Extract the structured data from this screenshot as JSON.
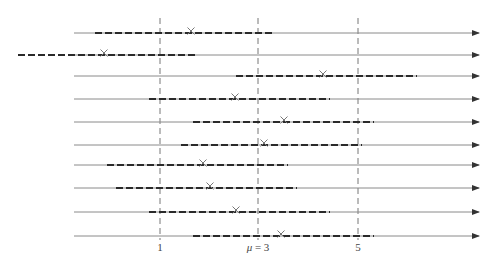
{
  "diagram": {
    "colors": {
      "axis_line": "#8a8a8a",
      "interval": "#2a2a2a",
      "reference": "#777777",
      "marker": "#777777"
    },
    "scale": {
      "x_px_at_value_1": 160,
      "px_per_unit": 49.5
    },
    "axis": {
      "x_start": 74,
      "x_end": 479
    },
    "reference_lines": [
      {
        "value": 1,
        "x": 160,
        "label": "1"
      },
      {
        "value": 3,
        "x": 258,
        "label": "μ = 3"
      },
      {
        "value": 5,
        "x": 358,
        "label": "5"
      }
    ],
    "rows": [
      {
        "y": 33,
        "interval_start": 95,
        "interval_end": 274,
        "estimate_x": 191
      },
      {
        "y": 55,
        "interval_start": 18,
        "interval_end": 196,
        "estimate_x": 104
      },
      {
        "y": 76,
        "interval_start": 236,
        "interval_end": 417,
        "estimate_x": 323
      },
      {
        "y": 99,
        "interval_start": 149,
        "interval_end": 330,
        "estimate_x": 235
      },
      {
        "y": 122,
        "interval_start": 193,
        "interval_end": 374,
        "estimate_x": 284
      },
      {
        "y": 145,
        "interval_start": 181,
        "interval_end": 362,
        "estimate_x": 264
      },
      {
        "y": 165,
        "interval_start": 107,
        "interval_end": 288,
        "estimate_x": 203
      },
      {
        "y": 188,
        "interval_start": 116,
        "interval_end": 297,
        "estimate_x": 210
      },
      {
        "y": 212,
        "interval_start": 149,
        "interval_end": 330,
        "estimate_x": 236
      },
      {
        "y": 236,
        "interval_start": 193,
        "interval_end": 374,
        "estimate_x": 281
      }
    ],
    "labels": {
      "tick_1": "1",
      "tick_mu_symbol": "μ",
      "tick_mu_rest": " = 3",
      "tick_5": "5"
    }
  }
}
